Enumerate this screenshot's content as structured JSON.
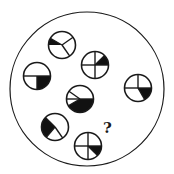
{
  "puzzle": {
    "background": "#ffffff",
    "stroke_color": "#1a1a1a",
    "fill_color": "#111111",
    "outer_circle": {
      "cx": 87,
      "cy": 89,
      "r": 77
    },
    "question_mark": {
      "text": "?",
      "x": 103,
      "y": 121
    },
    "small_radius": 13.5,
    "tiles": [
      {
        "id": "tile-top",
        "cx": 62,
        "cy": 45,
        "spokes": [
          150,
          35,
          -55
        ],
        "wedges": [
          [
            150,
            180
          ]
        ],
        "chord_left": [
          180
        ]
      },
      {
        "id": "tile-upper-mid",
        "cx": 95,
        "cy": 65,
        "spokes": [
          0,
          90,
          180,
          270,
          45
        ],
        "wedges": [
          [
            0,
            45
          ]
        ]
      },
      {
        "id": "tile-left",
        "cx": 37,
        "cy": 76,
        "spokes": [
          0,
          180,
          270
        ],
        "wedges": [
          [
            270,
            360
          ]
        ]
      },
      {
        "id": "tile-right",
        "cx": 138,
        "cy": 88,
        "spokes": [
          90,
          180,
          0,
          -60
        ],
        "wedges": [
          [
            300,
            360
          ]
        ]
      },
      {
        "id": "tile-center",
        "cx": 80,
        "cy": 99,
        "spokes": [
          0,
          180,
          145,
          210
        ],
        "wedges": [
          [
            210,
            360
          ]
        ]
      },
      {
        "id": "tile-lower-left",
        "cx": 55,
        "cy": 127,
        "spokes": [
          135,
          -55,
          230
        ],
        "wedges": [
          [
            135,
            230
          ]
        ]
      },
      {
        "id": "tile-bottom",
        "cx": 88,
        "cy": 146,
        "spokes": [
          0,
          90,
          180,
          270,
          -45
        ],
        "wedges": [
          [
            315,
            360
          ]
        ]
      }
    ]
  }
}
